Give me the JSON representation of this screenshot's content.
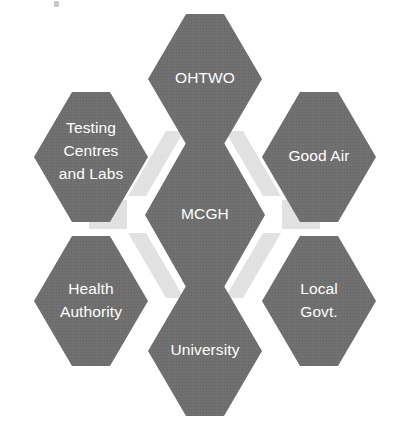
{
  "diagram": {
    "type": "honeycomb-cluster",
    "title": "",
    "background_color": "#ffffff",
    "hex_fill_color": "#6e6e6e",
    "hex_text_color": "#ffffff",
    "connector_color": "#e2e2e2",
    "center": {
      "id": "mcgh",
      "label": "MCGH",
      "lines": [
        "MCGH"
      ],
      "position": "center"
    },
    "nodes": [
      {
        "id": "ohtwo",
        "label": "OHTWO",
        "lines": [
          "OHTWO"
        ],
        "position": "top"
      },
      {
        "id": "good-air",
        "label": "Good Air",
        "lines": [
          "Good Air"
        ],
        "position": "upper-right"
      },
      {
        "id": "local-govt",
        "label": "Local Govt.",
        "lines": [
          "Local",
          "Govt."
        ],
        "position": "lower-right"
      },
      {
        "id": "university",
        "label": "University",
        "lines": [
          "University"
        ],
        "position": "bottom"
      },
      {
        "id": "health-authority",
        "label": "Health Authority",
        "lines": [
          "Health",
          "Authority"
        ],
        "position": "lower-left"
      },
      {
        "id": "testing-centres-and-labs",
        "label": "Testing Centres and Labs",
        "lines": [
          "Testing",
          "Centres",
          "and Labs"
        ],
        "position": "upper-left"
      }
    ],
    "connectors": [
      {
        "id": "connector-ohtwo-good-air",
        "from": "ohtwo",
        "to": "good-air"
      },
      {
        "id": "connector-good-air-local-govt",
        "from": "good-air",
        "to": "local-govt"
      },
      {
        "id": "connector-local-govt-university",
        "from": "local-govt",
        "to": "university"
      },
      {
        "id": "connector-university-health-authority",
        "from": "university",
        "to": "health-authority"
      },
      {
        "id": "connector-health-authority-testing",
        "from": "health-authority",
        "to": "testing-centres-and-labs"
      },
      {
        "id": "connector-testing-ohtwo",
        "from": "testing-centres-and-labs",
        "to": "ohtwo"
      }
    ]
  }
}
